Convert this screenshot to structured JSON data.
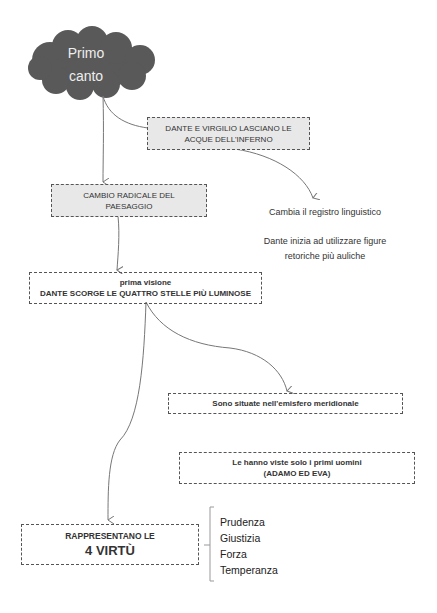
{
  "root": {
    "title_line1": "Primo",
    "title_line2": "canto",
    "shape": "cloud",
    "fill_color": "#595959"
  },
  "nodes": {
    "lasciano": {
      "line1": "DANTE E VIRGILIO LASCIANO LE",
      "line2": "ACQUE DELL'INFERNO"
    },
    "cambio": {
      "line1": "CAMBIO RADICALE DEL",
      "line2": "PAESAGGIO"
    },
    "registro": {
      "text": "Cambia il registro linguistico"
    },
    "figure": {
      "line1": "Dante inizia ad utilizzare figure",
      "line2": "retoriche più auliche"
    },
    "visione": {
      "line1": "prima visione",
      "line2": "DANTE SCORGE LE  QUATTRO STELLE PIÙ LUMINOSE"
    },
    "emisfero": {
      "text": "Sono  situate nell'emisfero meridionale"
    },
    "uomini": {
      "line1": "Le hanno viste solo i primi uomini",
      "line2": "(ADAMO ED EVA)"
    },
    "virtu": {
      "line1": "RAPPRESENTANO LE",
      "line2": "4 VIRTÙ"
    }
  },
  "virtues": [
    "Prudenza",
    "Giustizia",
    "Forza",
    "Temperanza"
  ],
  "colors": {
    "box_fill_grey": "#e8e8e8",
    "border": "#555555",
    "arrow": "#777777"
  }
}
